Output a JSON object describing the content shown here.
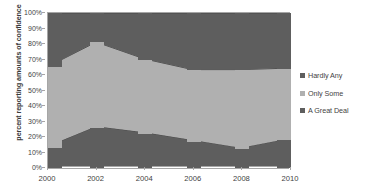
{
  "chart_data": {
    "type": "area",
    "subtype": "100% stacked area with column markers",
    "title": "",
    "xlabel": "",
    "ylabel": "percent reporting amounts of confidence",
    "categories": [
      "2000",
      "2002",
      "2004",
      "2006",
      "2008",
      "2010"
    ],
    "x": [
      2000,
      2002,
      2004,
      2006,
      2008,
      2010
    ],
    "ylim": [
      0,
      100
    ],
    "yticks": [
      0,
      10,
      20,
      30,
      40,
      50,
      60,
      70,
      80,
      90,
      100
    ],
    "ytick_labels": [
      "0%",
      "10%",
      "20%",
      "30%",
      "40%",
      "50%",
      "60%",
      "70%",
      "80%",
      "90%",
      "100%"
    ],
    "grid": true,
    "legend_position": "right",
    "stack_order_bottom_to_top": [
      "A Great Deal",
      "Only Some",
      "Hardly Any"
    ],
    "series": [
      {
        "name": "A Great Deal",
        "color": "#5e5e5e",
        "values": [
          13,
          26,
          22,
          17,
          12,
          18
        ]
      },
      {
        "name": "Only Some",
        "color": "#b0b0b0",
        "values": [
          52,
          55,
          48,
          46,
          51,
          46
        ]
      },
      {
        "name": "Hardly Any",
        "color": "#5e5e5e",
        "values": [
          35,
          19,
          30,
          37,
          37,
          36
        ]
      }
    ],
    "cumulative_boundaries": {
      "lower_boundary": [
        13,
        26,
        22,
        17,
        12,
        18
      ],
      "upper_boundary": [
        65,
        81,
        70,
        63,
        63,
        64
      ]
    }
  },
  "legend": {
    "items": [
      {
        "label": "Hardly Any",
        "color": "#5e5e5e"
      },
      {
        "label": "Only Some",
        "color": "#b0b0b0"
      },
      {
        "label": "A Great Deal",
        "color": "#5e5e5e"
      }
    ]
  },
  "axes": {
    "y_title": "percent reporting amounts of confidence"
  }
}
